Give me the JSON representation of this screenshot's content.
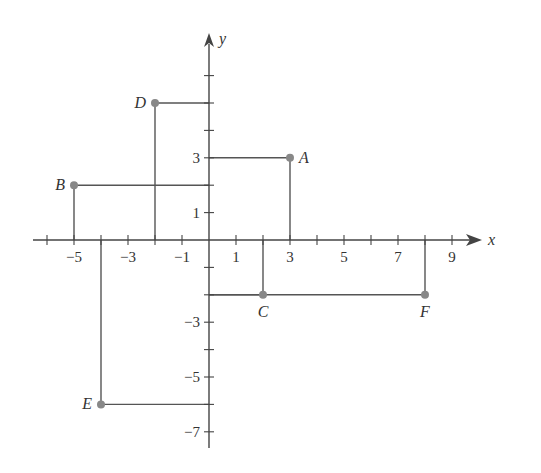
{
  "diagram": {
    "type": "cartesian-plane",
    "axes": {
      "x_label": "x",
      "y_label": "y",
      "x_ticks": [
        -6,
        -5,
        -4,
        -3,
        -2,
        -1,
        0,
        1,
        2,
        3,
        4,
        5,
        6,
        7,
        8,
        9
      ],
      "x_tick_labels": [
        {
          "value": -5,
          "text": "−5"
        },
        {
          "value": -3,
          "text": "−3"
        },
        {
          "value": -1,
          "text": "−1"
        },
        {
          "value": 1,
          "text": "1"
        },
        {
          "value": 3,
          "text": "3"
        },
        {
          "value": 5,
          "text": "5"
        },
        {
          "value": 7,
          "text": "7"
        },
        {
          "value": 9,
          "text": "9"
        }
      ],
      "y_ticks": [
        -7,
        -6,
        -5,
        -4,
        -3,
        -2,
        -1,
        1,
        2,
        3,
        4,
        5,
        6
      ],
      "y_tick_labels": [
        {
          "value": 3,
          "text": "3"
        },
        {
          "value": 1,
          "text": "1"
        },
        {
          "value": -3,
          "text": "−3"
        },
        {
          "value": -5,
          "text": "−5"
        },
        {
          "value": -7,
          "text": "−7"
        }
      ],
      "x_range": [
        -6.5,
        10
      ],
      "y_range": [
        -7.5,
        7.5
      ]
    },
    "points": [
      {
        "label": "A",
        "x": 3,
        "y": 3,
        "label_pos": "right"
      },
      {
        "label": "B",
        "x": -5,
        "y": 2,
        "label_pos": "left"
      },
      {
        "label": "C",
        "x": 2,
        "y": -2,
        "label_pos": "below"
      },
      {
        "label": "D",
        "x": -2,
        "y": 5,
        "label_pos": "left"
      },
      {
        "label": "E",
        "x": -4,
        "y": -6,
        "label_pos": "left"
      },
      {
        "label": "F",
        "x": 8,
        "y": -2,
        "label_pos": "below"
      }
    ],
    "colors": {
      "axis": "#444444",
      "guide": "#555555",
      "point": "#888888",
      "text": "#333333"
    }
  }
}
